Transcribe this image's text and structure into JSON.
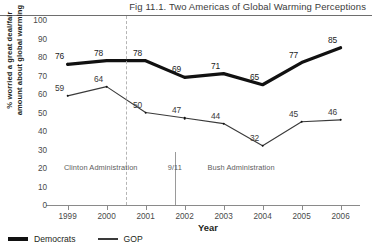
{
  "figure": {
    "title": "Fig 11.1. Two Americas of Global Warming Perceptions"
  },
  "chart_data": {
    "type": "line",
    "title": "Fig 11.1. Two Americas of Global Warming Perceptions",
    "xlabel": "Year",
    "ylabel": "% worried a great deal/fair amount about global warming",
    "ylabel_line1": "% worried a great deal/fair",
    "ylabel_line2": "amount about global warming",
    "categories": [
      "1999",
      "2000",
      "2001",
      "2002",
      "2003",
      "2004",
      "2005",
      "2006"
    ],
    "x": [
      1999,
      2000,
      2001,
      2002,
      2003,
      2004,
      2005,
      2006
    ],
    "xlim": [
      1998.6,
      2006.6
    ],
    "ylim": [
      0,
      100
    ],
    "yticks": [
      100,
      90,
      80,
      70,
      60,
      50,
      40,
      30,
      20,
      10,
      0
    ],
    "grid": false,
    "legend_position": "bottom-left",
    "series": [
      {
        "name": "Democrats",
        "values": [
          76,
          78,
          78,
          69,
          71,
          65,
          77,
          85
        ],
        "color": "#111111",
        "line_width": "thick"
      },
      {
        "name": "GOP",
        "values": [
          59,
          64,
          50,
          47,
          44,
          32,
          45,
          46
        ],
        "color": "#3a3a3a",
        "line_width": "thin"
      }
    ],
    "annotations": [
      {
        "text": "Clinton Administration",
        "x": 1999.85,
        "y": 20
      },
      {
        "text": "9/11",
        "x": 2001.75,
        "y": 20
      },
      {
        "text": "Bush Administration",
        "x": 2003.45,
        "y": 20
      }
    ],
    "reference_lines": [
      {
        "style": "dashed",
        "x": 2000.5
      },
      {
        "style": "solid",
        "x": 2001.75
      }
    ]
  },
  "legend": {
    "items": [
      {
        "label": "Democrats"
      },
      {
        "label": "GOP"
      }
    ]
  }
}
